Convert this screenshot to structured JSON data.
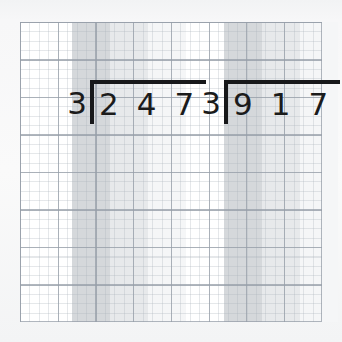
{
  "worksheet": {
    "title": "Long division grid worksheet",
    "paper_color": "#f4f5f6",
    "grid_color": "#969ea8",
    "ink_color": "#17181a"
  },
  "grid": {
    "columns": 8,
    "rows": 8,
    "minor_per_major": 4
  },
  "bands": [
    {
      "name": "band-dark",
      "color": "#d5d8db"
    },
    {
      "name": "band-medium",
      "color": "#e7e9eb"
    },
    {
      "name": "band-light",
      "color": "#f4f5f6"
    }
  ],
  "problems": [
    {
      "id": "problem-1",
      "divisor": "3",
      "dividend": "247",
      "dividend_digits": [
        "2",
        "4",
        "7"
      ],
      "quotient": "",
      "bands": [
        {
          "name": "band-dark",
          "left": 52,
          "width": 38,
          "color": "#d5d8db"
        },
        {
          "name": "band-medium",
          "left": 90,
          "width": 38,
          "color": "#e7e9eb"
        },
        {
          "name": "band-light",
          "left": 128,
          "width": 38,
          "color": "#f5f6f7"
        }
      ],
      "layout": {
        "left": 44,
        "top": 58,
        "bracket_width": 116,
        "bracket_height": 44
      }
    },
    {
      "id": "problem-2",
      "divisor": "3",
      "dividend": "917",
      "dividend_digits": [
        "9",
        "1",
        "7"
      ],
      "quotient": "",
      "bands": [
        {
          "name": "band-dark",
          "left": 204,
          "width": 38,
          "color": "#d5d8db"
        },
        {
          "name": "band-medium",
          "left": 242,
          "width": 38,
          "color": "#e7e9eb"
        },
        {
          "name": "band-light",
          "left": 280,
          "width": 38,
          "color": "#f5f6f7"
        }
      ],
      "layout": {
        "left": 178,
        "top": 58,
        "bracket_width": 116,
        "bracket_height": 44
      }
    }
  ],
  "chart_data": {
    "type": "table",
    "categories": [
      "problem-1",
      "problem-2"
    ],
    "series": [
      {
        "name": "divisor",
        "values": [
          3,
          3
        ]
      },
      {
        "name": "dividend",
        "values": [
          247,
          917
        ]
      }
    ],
    "annotations": [
      "3 ⟌ 247",
      "3 ⟌ 917"
    ]
  }
}
